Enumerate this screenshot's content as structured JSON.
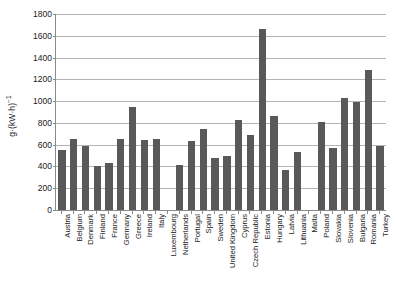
{
  "chart_data": {
    "type": "bar",
    "title": "",
    "xlabel": "",
    "ylabel": "g·(kW·h)",
    "ylabel_exponent": "−1",
    "ylim": [
      0,
      1800
    ],
    "ytick_step": 200,
    "yticks": [
      "0",
      "200",
      "400",
      "600",
      "800",
      "1000",
      "1200",
      "1400",
      "1600",
      "1800"
    ],
    "grid": "horizontal",
    "legend": "none",
    "bar_color": "#595959",
    "gridline_color": "#b4b4b4",
    "axis_color": "#8a8a8a",
    "categories": [
      "Austria",
      "Belgium",
      "Denmark",
      "Finland",
      "France",
      "Germany",
      "Greece",
      "Ireland",
      "Italy",
      "Luxembourg",
      "Netherlands",
      "Portugal",
      "Spain",
      "Sweden",
      "United Kingdom",
      "Cyprus",
      "Czech Republic",
      "Estonia",
      "Hungary",
      "Latvia",
      "Lithuania",
      "Malta",
      "Poland",
      "Slovakia",
      "Slovenia",
      "Bulgaria",
      "Romania",
      "Turkey"
    ],
    "values": [
      555,
      650,
      585,
      400,
      435,
      655,
      950,
      640,
      655,
      0,
      410,
      630,
      740,
      475,
      500,
      825,
      690,
      1665,
      865,
      365,
      530,
      0,
      805,
      565,
      1030,
      995,
      1285,
      590
    ]
  }
}
